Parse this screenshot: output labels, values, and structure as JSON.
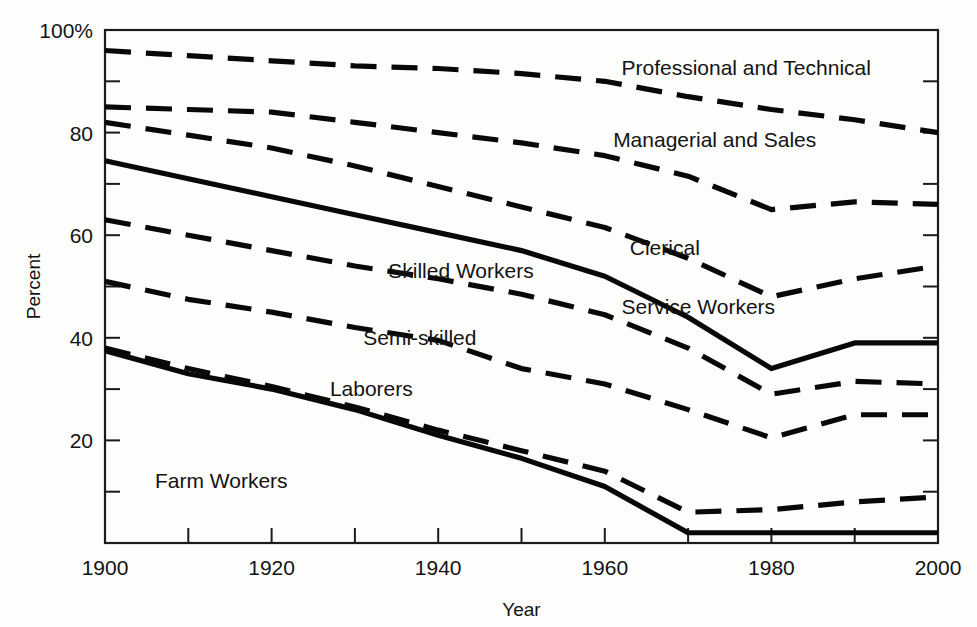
{
  "chart_data": {
    "type": "line",
    "title": "",
    "xlabel": "Year",
    "ylabel": "Percent",
    "xlim": [
      1900,
      2000
    ],
    "ylim": [
      0,
      100
    ],
    "grid": false,
    "legend": "inline-labels",
    "x_ticks_major": [
      1900,
      1920,
      1940,
      1960,
      1980,
      2000
    ],
    "x_ticks_minor": [
      1910,
      1930,
      1950,
      1970,
      1990
    ],
    "y_ticks_major": [
      20,
      40,
      60,
      80,
      100
    ],
    "y_ticks_minor": [
      10,
      30,
      50,
      70,
      90
    ],
    "y_tick_labels": [
      "20",
      "40",
      "60",
      "80",
      "100%"
    ],
    "x_tick_labels": [
      "1900",
      "1920",
      "1940",
      "1960",
      "1980",
      "2000"
    ],
    "x": [
      1900,
      1910,
      1920,
      1930,
      1940,
      1950,
      1960,
      1970,
      1980,
      1990,
      2000
    ],
    "series": [
      {
        "name": "Professional and Technical",
        "style": "dashed",
        "label": "Professional and Technical",
        "values": [
          96,
          95,
          94,
          93,
          92.5,
          91.5,
          90,
          87,
          84.5,
          82.5,
          80
        ]
      },
      {
        "name": "Managerial and Sales",
        "style": "dashed",
        "label": "Managerial and Sales",
        "values": [
          85,
          84.5,
          84,
          82,
          80,
          78,
          75.5,
          71.5,
          65,
          66.5,
          66
        ]
      },
      {
        "name": "Clerical",
        "style": "dashed",
        "label": "Clerical",
        "values": [
          82,
          79.5,
          77,
          73.5,
          69.5,
          65.5,
          61.5,
          55.5,
          48,
          51.5,
          54
        ]
      },
      {
        "name": "Service Workers",
        "style": "solid",
        "label": "Service Workers",
        "values": [
          74.5,
          71,
          67.5,
          64,
          60.5,
          57,
          52,
          44,
          34,
          39,
          39
        ]
      },
      {
        "name": "Skilled Workers",
        "style": "dashed",
        "label": "Skilled Workers",
        "values": [
          63,
          60,
          57,
          54,
          51.5,
          48.5,
          44.5,
          38,
          29,
          31.5,
          31
        ]
      },
      {
        "name": "Semi-skilled",
        "style": "dashed",
        "label": "Semi-skilled",
        "values": [
          51,
          47.5,
          45,
          42,
          39.5,
          34,
          31,
          26,
          20.5,
          25,
          25
        ]
      },
      {
        "name": "Laborers",
        "style": "dashed",
        "label": "Laborers",
        "values": [
          38,
          34,
          30.5,
          26.5,
          22,
          18,
          14,
          6,
          6.5,
          8,
          9
        ]
      },
      {
        "name": "Farm Workers",
        "style": "solid",
        "label": "Farm Workers",
        "values": [
          37.5,
          33,
          30,
          26,
          21,
          16.5,
          11,
          2,
          2,
          2,
          2
        ]
      }
    ],
    "annotations": [
      {
        "text": "Professional and Technical",
        "x": 1962,
        "y": 92.5
      },
      {
        "text": "Managerial and Sales",
        "x": 1961,
        "y": 78.5
      },
      {
        "text": "Clerical",
        "x": 1963,
        "y": 57.5
      },
      {
        "text": "Service Workers",
        "x": 1962,
        "y": 46
      },
      {
        "text": "Skilled Workers",
        "x": 1934,
        "y": 53
      },
      {
        "text": "Semi-skilled",
        "x": 1931,
        "y": 40
      },
      {
        "text": "Laborers",
        "x": 1927,
        "y": 30
      },
      {
        "text": "Farm Workers",
        "x": 1906,
        "y": 12
      }
    ],
    "colors": {
      "line": "#080808",
      "axis": "#1b1b1b",
      "text": "#131313",
      "background": "#fdfdfc"
    }
  }
}
